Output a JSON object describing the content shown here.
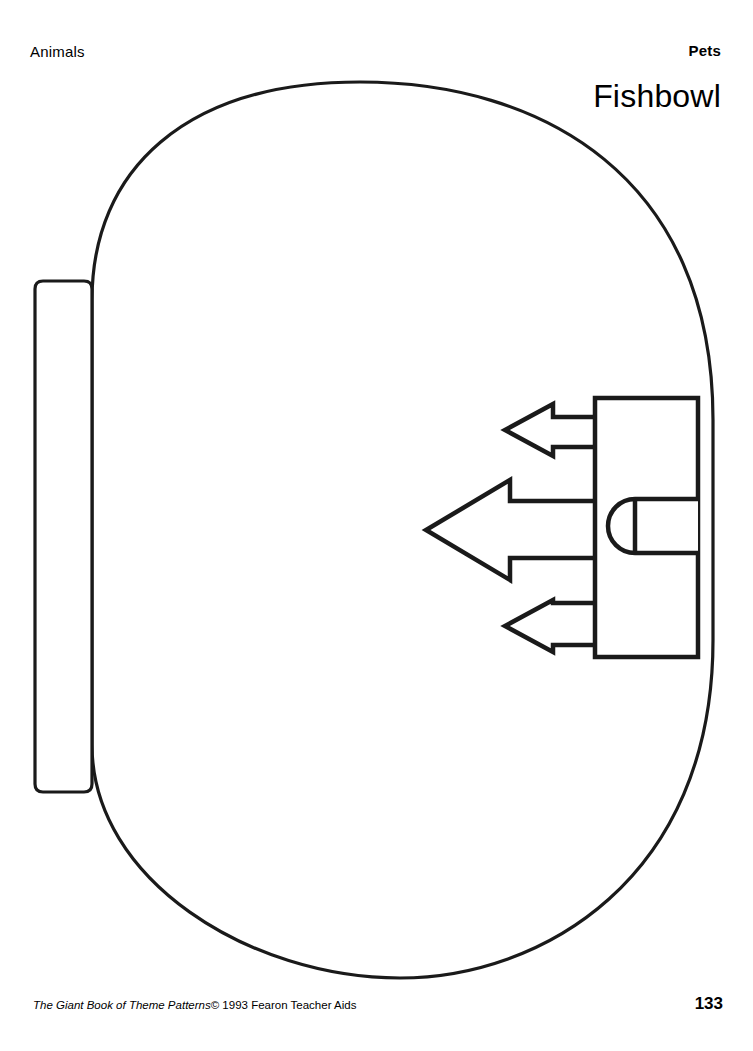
{
  "page": {
    "header_category": "Animals",
    "header_section": "Pets",
    "title": "Fishbowl",
    "page_number": "133"
  },
  "footer": {
    "credit_title": "The Giant Book of Theme Patterns",
    "credit_rest": "© 1993 Fearon Teacher Aids"
  },
  "artwork": {
    "description": "Line-art coloring pattern of a fishbowl with a stylized fish",
    "stroke_color": "#1a1a1a",
    "fill_color": "#ffffff",
    "shapes": [
      {
        "name": "bowl-outline",
        "kind": "rounded-oval",
        "stroke_width": 3.2
      },
      {
        "name": "bowl-side-panel",
        "kind": "rounded-rectangle",
        "stroke_width": 3.2
      },
      {
        "name": "fish-body",
        "kind": "rectangle",
        "stroke_width": 4.5
      },
      {
        "name": "fish-tail-detail",
        "kind": "d-shape",
        "stroke_width": 4.5
      },
      {
        "name": "fish-fin-top",
        "kind": "arrow",
        "stroke_width": 4.5
      },
      {
        "name": "fish-fin-middle",
        "kind": "arrow",
        "stroke_width": 4.5
      },
      {
        "name": "fish-fin-bottom",
        "kind": "arrow",
        "stroke_width": 4.5
      }
    ]
  }
}
